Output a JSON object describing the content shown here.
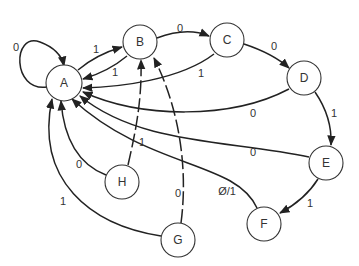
{
  "diagram": {
    "type": "state-transition",
    "nodes": [
      {
        "id": "A",
        "label": "A",
        "x": 64,
        "y": 83
      },
      {
        "id": "B",
        "label": "B",
        "x": 140,
        "y": 42
      },
      {
        "id": "C",
        "label": "C",
        "x": 227,
        "y": 40
      },
      {
        "id": "D",
        "label": "D",
        "x": 304,
        "y": 78
      },
      {
        "id": "E",
        "label": "E",
        "x": 326,
        "y": 163
      },
      {
        "id": "F",
        "label": "F",
        "x": 264,
        "y": 224
      },
      {
        "id": "G",
        "label": "G",
        "x": 178,
        "y": 240
      },
      {
        "id": "H",
        "label": "H",
        "x": 122,
        "y": 182
      }
    ],
    "edges": [
      {
        "from": "A",
        "to": "A",
        "label": "0"
      },
      {
        "from": "A",
        "to": "B",
        "label": "1"
      },
      {
        "from": "B",
        "to": "A",
        "label": "1"
      },
      {
        "from": "B",
        "to": "C",
        "label": "0"
      },
      {
        "from": "C",
        "to": "A",
        "label": "1"
      },
      {
        "from": "C",
        "to": "D",
        "label": "0"
      },
      {
        "from": "D",
        "to": "A",
        "label": "0"
      },
      {
        "from": "D",
        "to": "E",
        "label": "1"
      },
      {
        "from": "E",
        "to": "A",
        "label": "0"
      },
      {
        "from": "E",
        "to": "F",
        "label": "1"
      },
      {
        "from": "F",
        "to": "A",
        "label": "Ø/1"
      },
      {
        "from": "H",
        "to": "A",
        "label": "0"
      },
      {
        "from": "H",
        "to": "B",
        "label": "1",
        "style": "dashed"
      },
      {
        "from": "G",
        "to": "A",
        "label": "1"
      },
      {
        "from": "G",
        "to": "B",
        "label": "0",
        "style": "dashed"
      }
    ]
  }
}
